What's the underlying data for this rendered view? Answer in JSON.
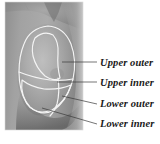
{
  "figure": {
    "image_kind": "grayscale-photograph",
    "background_color": "#ffffff",
    "photo": {
      "name": "breast-profile-photo",
      "rect": {
        "x": 5,
        "y": 2,
        "width": 78,
        "height": 128
      },
      "tones": {
        "skin_light": "#b9b9b9",
        "skin_mid": "#9b9b9b",
        "skin_dark": "#7b7b7b",
        "shadow": "#636363"
      }
    },
    "overlay": {
      "stroke_color": "#f2f2f2",
      "stroke_width": 1.1,
      "regions": [
        {
          "id": "upper-outer",
          "label": "Upper outer"
        },
        {
          "id": "upper-inner",
          "label": "Upper inner"
        },
        {
          "id": "lower-outer",
          "label": "Lower outer"
        },
        {
          "id": "lower-inner",
          "label": "Lower inner"
        }
      ]
    },
    "leader_color": "#3a3a3a",
    "leader_width": 0.7,
    "labels": [
      {
        "id": "upper-outer",
        "text": "Upper outer",
        "text_x": 100,
        "text_y": 66,
        "leader": {
          "x1": 62,
          "y1": 62,
          "x2": 97,
          "y2": 62
        }
      },
      {
        "id": "upper-inner",
        "text": "Upper inner",
        "text_x": 100,
        "text_y": 86,
        "leader": {
          "x1": 57,
          "y1": 82,
          "x2": 97,
          "y2": 82
        }
      },
      {
        "id": "lower-outer",
        "text": "Lower outer",
        "text_x": 100,
        "text_y": 107,
        "leader": {
          "x1": 62,
          "y1": 96,
          "x2": 97,
          "y2": 104
        }
      },
      {
        "id": "lower-inner",
        "text": "Lower inner",
        "text_x": 100,
        "text_y": 127,
        "leader": {
          "x1": 42,
          "y1": 108,
          "x2": 97,
          "y2": 124
        }
      }
    ]
  }
}
